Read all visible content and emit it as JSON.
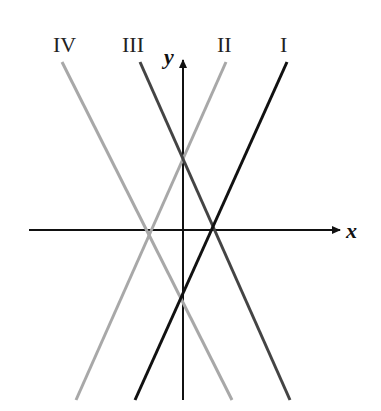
{
  "diagram": {
    "type": "line-graph",
    "axes": {
      "x_label": "x",
      "y_label": "y"
    },
    "lines": [
      {
        "label": "I",
        "color": "#111111",
        "slope_sign": "positive",
        "x1": 287,
        "y1": 62,
        "x2": 135,
        "y2": 400
      },
      {
        "label": "II",
        "color": "#a8a8a8",
        "slope_sign": "positive",
        "x1": 226,
        "y1": 62,
        "x2": 76,
        "y2": 400
      },
      {
        "label": "III",
        "color": "#444444",
        "slope_sign": "negative",
        "x1": 140,
        "y1": 62,
        "x2": 290,
        "y2": 400
      },
      {
        "label": "IV",
        "color": "#a8a8a8",
        "slope_sign": "negative",
        "x1": 62,
        "y1": 62,
        "x2": 232,
        "y2": 400
      }
    ]
  },
  "labels": {
    "I": "I",
    "II": "II",
    "III": "III",
    "IV": "IV",
    "x": "x",
    "y": "y"
  }
}
